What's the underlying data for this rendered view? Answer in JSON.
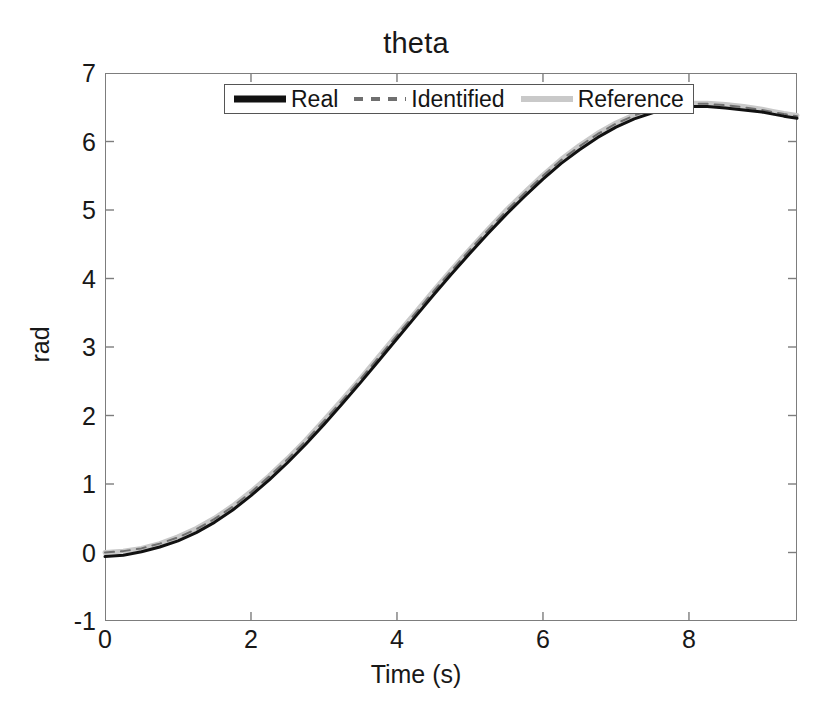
{
  "chart_data": {
    "type": "line",
    "title": "theta",
    "xlabel": "Time (s)",
    "ylabel": "rad",
    "xlim": [
      0,
      9.48
    ],
    "ylim": [
      -1,
      7
    ],
    "xticks": [
      0,
      2,
      4,
      6,
      8
    ],
    "xtick_labels": [
      "0",
      "2",
      "4",
      "6",
      "8"
    ],
    "yticks": [
      -1,
      0,
      1,
      2,
      3,
      4,
      5,
      6,
      7
    ],
    "ytick_labels": [
      "-1",
      "0",
      "1",
      "2",
      "3",
      "4",
      "5",
      "6",
      "7"
    ],
    "grid": false,
    "legend_position": "upper center",
    "x": [
      0,
      0.25,
      0.5,
      0.75,
      1.0,
      1.25,
      1.5,
      1.75,
      2.0,
      2.25,
      2.5,
      2.75,
      3.0,
      3.25,
      3.5,
      3.75,
      4.0,
      4.25,
      4.5,
      4.75,
      5.0,
      5.25,
      5.5,
      5.75,
      6.0,
      6.25,
      6.5,
      6.75,
      7.0,
      7.25,
      7.5,
      7.75,
      8.0,
      8.25,
      8.5,
      8.75,
      9.0,
      9.15,
      9.3,
      9.48
    ],
    "series": [
      {
        "name": "Real",
        "color": "#111111",
        "style": "solid",
        "width": 3.0,
        "values": [
          -0.06,
          -0.04,
          0.01,
          0.08,
          0.17,
          0.29,
          0.44,
          0.62,
          0.83,
          1.06,
          1.31,
          1.58,
          1.87,
          2.17,
          2.48,
          2.8,
          3.12,
          3.44,
          3.76,
          4.07,
          4.37,
          4.66,
          4.94,
          5.2,
          5.45,
          5.68,
          5.88,
          6.06,
          6.21,
          6.33,
          6.42,
          6.48,
          6.51,
          6.51,
          6.49,
          6.46,
          6.43,
          6.4,
          6.37,
          6.34
        ]
      },
      {
        "name": "Identified",
        "color": "#6f6f6f",
        "style": "dashed",
        "width": 2.0,
        "values": [
          0.0,
          0.02,
          0.06,
          0.13,
          0.22,
          0.34,
          0.49,
          0.67,
          0.88,
          1.11,
          1.36,
          1.63,
          1.92,
          2.22,
          2.53,
          2.85,
          3.17,
          3.49,
          3.81,
          4.12,
          4.42,
          4.71,
          4.99,
          5.25,
          5.5,
          5.73,
          5.93,
          6.11,
          6.26,
          6.38,
          6.47,
          6.52,
          6.55,
          6.55,
          6.53,
          6.5,
          6.46,
          6.43,
          6.4,
          6.37
        ]
      },
      {
        "name": "Reference",
        "color": "#c9c9c9",
        "style": "solid",
        "width": 5.0,
        "values": [
          0.0,
          0.02,
          0.06,
          0.13,
          0.23,
          0.35,
          0.5,
          0.68,
          0.89,
          1.12,
          1.37,
          1.64,
          1.93,
          2.23,
          2.54,
          2.86,
          3.18,
          3.5,
          3.82,
          4.13,
          4.43,
          4.72,
          5.0,
          5.26,
          5.51,
          5.74,
          5.94,
          6.12,
          6.27,
          6.39,
          6.48,
          6.53,
          6.56,
          6.56,
          6.54,
          6.51,
          6.47,
          6.44,
          6.41,
          6.38
        ]
      }
    ]
  },
  "legend": {
    "entries": [
      {
        "label": "Real",
        "swatch": "thick-solid-black-line-icon"
      },
      {
        "label": "Identified",
        "swatch": "dashed-gray-line-icon"
      },
      {
        "label": "Reference",
        "swatch": "thick-light-gray-line-icon"
      }
    ]
  }
}
